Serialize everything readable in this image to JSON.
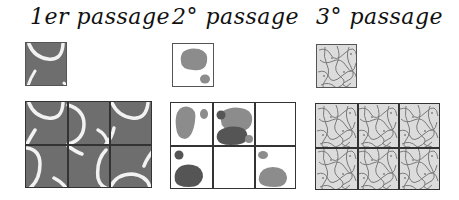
{
  "figure": {
    "type": "texture-tiling-diagram",
    "columns": [
      {
        "id": "pass1",
        "title": "1er passage",
        "tile_style": "dark grey with white curved strokes",
        "tile_color": "#6e6e6e",
        "stroke_color": "#f2f2f2",
        "grid": {
          "rows": 2,
          "cols": 3
        }
      },
      {
        "id": "pass2",
        "title": "2° passage",
        "tile_style": "white with grey blobs",
        "blob_colors": {
          "light": "#8c8c8c",
          "dark": "#555555"
        },
        "grid": {
          "rows": 2,
          "cols": 3
        }
      },
      {
        "id": "pass3",
        "title": "3° passage",
        "tile_style": "fine grey noise texture",
        "texture_colors": {
          "base": "#d9d9d9",
          "stroke": "#7a7a7a"
        },
        "grid": {
          "rows": 2,
          "cols": 3
        }
      }
    ]
  }
}
